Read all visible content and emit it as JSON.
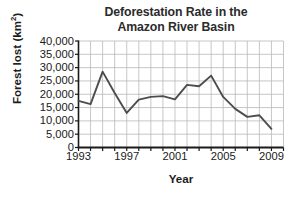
{
  "chart_data": {
    "type": "line",
    "title": "Deforestation Rate in the Amazon River Basin",
    "title_line1": "Deforestation Rate in the",
    "title_line2": "Amazon River Basin",
    "xlabel": "Year",
    "ylabel_text": "Forest lost (km",
    "ylabel_sup": "2",
    "ylabel_tail": ")",
    "ylabel": "Forest lost (km²)",
    "xlim": [
      1993,
      2010
    ],
    "ylim": [
      0,
      40000
    ],
    "grid": true,
    "legend": "none",
    "line_color": "#4d4d4d",
    "grid_color": "#b9b9b9",
    "axis_color": "#1a1a1a",
    "ytick_labels": [
      "40,000",
      "35,000",
      "30,000",
      "25,000",
      "20,000",
      "15,000",
      "10,000",
      "5,000",
      "0"
    ],
    "ytick_values": [
      40000,
      35000,
      30000,
      25000,
      20000,
      15000,
      10000,
      5000,
      0
    ],
    "xtick_labels": [
      "1993",
      "1997",
      "2001",
      "2005",
      "2009"
    ],
    "xtick_values": [
      1993,
      1997,
      2001,
      2005,
      2009
    ],
    "x_minor_ticks": [
      1993,
      1994,
      1995,
      1996,
      1997,
      1998,
      1999,
      2000,
      2001,
      2002,
      2003,
      2004,
      2005,
      2006,
      2007,
      2008,
      2009,
      2010
    ],
    "x": [
      1993,
      1994,
      1995,
      1996,
      1997,
      1998,
      1999,
      2000,
      2001,
      2002,
      2003,
      2004,
      2005,
      2006,
      2007,
      2008,
      2009
    ],
    "values": [
      17500,
      16300,
      28500,
      20500,
      13000,
      18000,
      19000,
      19300,
      18100,
      23500,
      23000,
      27000,
      19000,
      14500,
      11500,
      12100,
      7000
    ],
    "series": [
      {
        "name": "Forest lost",
        "values": [
          17500,
          16300,
          28500,
          20500,
          13000,
          18000,
          19000,
          19300,
          18100,
          23500,
          23000,
          27000,
          19000,
          14500,
          11500,
          12100,
          7000
        ]
      }
    ]
  }
}
